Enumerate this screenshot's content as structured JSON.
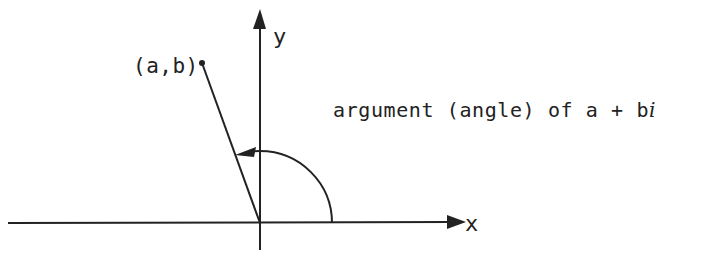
{
  "diagram": {
    "title": "argument (angle) of a + bi",
    "caption_prefix": "argument (angle) of a + b",
    "caption_i": "i",
    "point_label": "(a,b)",
    "x_axis_label": "x",
    "y_axis_label": "y",
    "colors": {
      "stroke": "#222222",
      "background": "#ffffff"
    },
    "geometry": {
      "origin": [
        260,
        223
      ],
      "point": [
        202,
        63
      ],
      "arc_radius": 72
    }
  }
}
